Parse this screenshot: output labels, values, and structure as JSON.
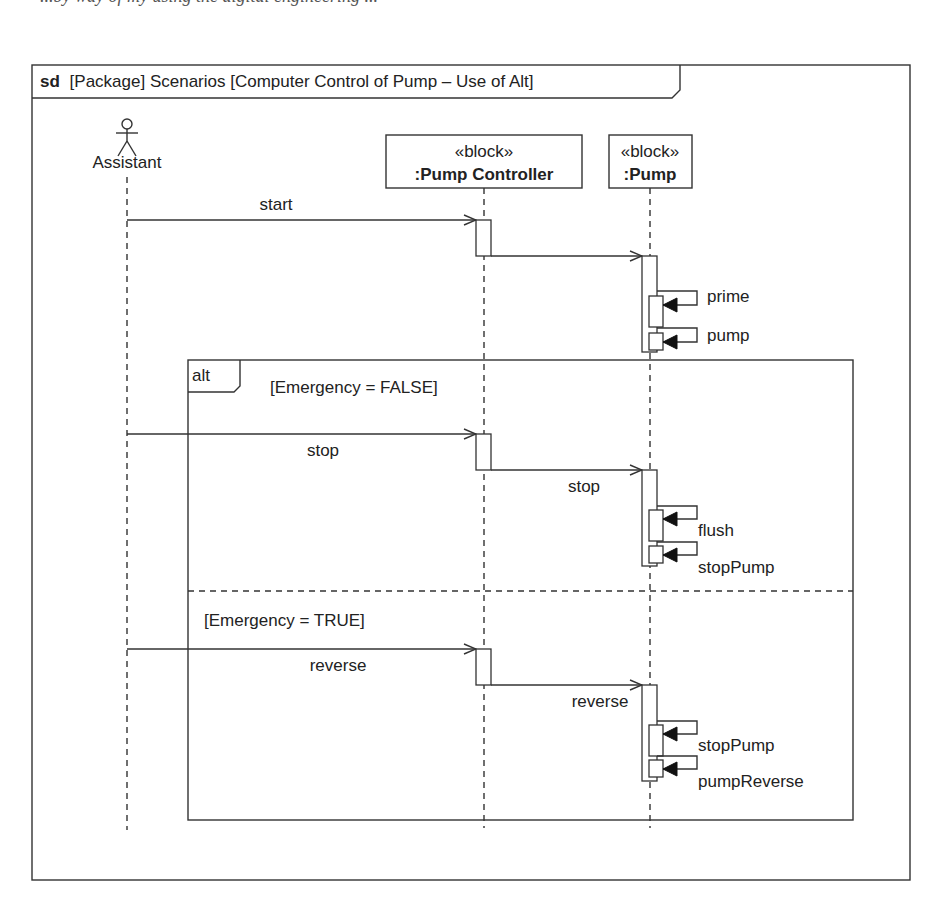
{
  "caption_fragment": "...by way of my using the digital engineering ...",
  "frame": {
    "kind": "sd",
    "title": "[Package] Scenarios [Computer Control of Pump – Use of Alt]"
  },
  "lifelines": {
    "actor": {
      "name": "Assistant"
    },
    "controller": {
      "stereotype": "«block»",
      "name": ":Pump Controller"
    },
    "pump": {
      "stereotype": "«block»",
      "name": ":Pump"
    }
  },
  "messages": {
    "start": "start",
    "prime": "prime",
    "pump": "pump",
    "stop_in": "stop",
    "stop_out": "stop",
    "flush": "flush",
    "stopPump1": "stopPump",
    "reverse_in": "reverse",
    "reverse_out": "reverse",
    "stopPump2": "stopPump",
    "pumpReverse": "pumpReverse"
  },
  "fragment": {
    "operator": "alt",
    "operands": [
      {
        "guard": "[Emergency = FALSE]"
      },
      {
        "guard": "[Emergency = TRUE]"
      }
    ]
  },
  "colors": {
    "line": "#333333",
    "text": "#222222",
    "background": "#ffffff"
  }
}
